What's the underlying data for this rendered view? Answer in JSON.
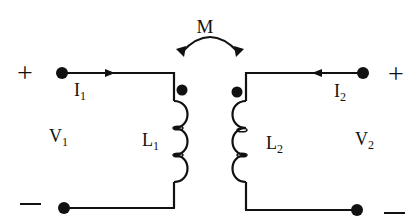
{
  "diagram": {
    "type": "mutually-coupled-inductors",
    "colors": {
      "stroke": "#111111",
      "background": "#ffffff"
    },
    "labels": {
      "mutual": "M",
      "left_plus": "+",
      "left_minus": "−",
      "right_plus": "+",
      "right_minus": "−",
      "current1_main": "I",
      "current1_sub": "1",
      "current2_main": "I",
      "current2_sub": "2",
      "voltage1_main": "V",
      "voltage1_sub": "1",
      "voltage2_main": "V",
      "voltage2_sub": "2",
      "inductor1_main": "L",
      "inductor1_sub": "1",
      "inductor2_main": "L",
      "inductor2_sub": "2"
    },
    "dot_convention": [
      "top-of-L1",
      "top-of-L2"
    ]
  }
}
